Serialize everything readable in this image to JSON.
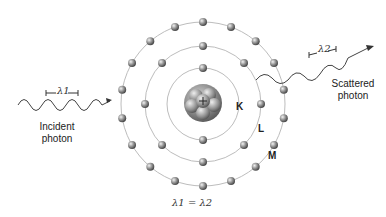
{
  "diagram": {
    "incident": {
      "label_line1": "Incident",
      "label_line2": "photon",
      "wavelength": "λ1",
      "sub": "1"
    },
    "scattered": {
      "label_line1": "Scattered",
      "label_line2": "photon",
      "wavelength": "λ2",
      "sub": "2"
    },
    "equation": "λ1 = λ2",
    "shells": [
      {
        "name": "K",
        "electrons": 2
      },
      {
        "name": "L",
        "electrons": 8
      },
      {
        "name": "M",
        "electrons": 18
      }
    ],
    "nucleus": {
      "charge_symbol": "+"
    },
    "colors": {
      "orbit": "#b8b8b8",
      "electron": "#7a7a7a",
      "wave": "#444444",
      "text": "#222222"
    }
  }
}
